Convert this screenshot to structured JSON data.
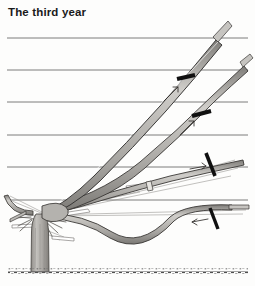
{
  "figure": {
    "title": "The third year",
    "background_color": "#fdfdfc"
  },
  "colors": {
    "ink": "#2b2b2b",
    "wire": "#6d6d6d",
    "branch_fill": "#b9b7b4",
    "branch_outline": "#3a3a3a",
    "trunk_fill": "#a9a7a3",
    "tie_black": "#111111",
    "ground": "#5a5a5a",
    "guide_line": "#9a9a9a"
  },
  "support_wires": {
    "label": "horizontal training wires",
    "count": 6,
    "x_start": 7,
    "x_end": 248,
    "y_positions": [
      38,
      70,
      102,
      135,
      167,
      200
    ]
  },
  "ground_line": {
    "label": "soil level",
    "y": 272,
    "x_start": 8,
    "x_end": 248
  },
  "trunk": {
    "label": "main trunk",
    "x": 37,
    "top_y": 215,
    "base_y": 272,
    "width": 13
  },
  "branches": [
    {
      "name": "upper-left-main-arm",
      "description": "steep left arm rising to top right",
      "tie_marker": true
    },
    {
      "name": "second-arm",
      "description": "second arm rising at shallower angle",
      "tie_marker": true
    },
    {
      "name": "third-arm",
      "description": "third arm nearly horizontal upper",
      "tie_marker": true
    },
    {
      "name": "lower-arm",
      "description": "lowest arm running along bottom wire",
      "tie_marker": true
    },
    {
      "name": "left-low-arm",
      "description": "short arm trained to the left",
      "tie_marker": false
    }
  ],
  "tie_markers": {
    "label": "pruning cut / tie marks",
    "count": 4,
    "items": [
      {
        "name": "tie-mark-1",
        "x": 186,
        "y": 78,
        "angle": -72
      },
      {
        "name": "tie-mark-2",
        "x": 201,
        "y": 114,
        "angle": -70
      },
      {
        "name": "tie-mark-3",
        "x": 211,
        "y": 164,
        "angle": -15
      },
      {
        "name": "tie-mark-4",
        "x": 214,
        "y": 218,
        "angle": -15
      }
    ]
  },
  "growth_arrows": {
    "label": "direction-of-growth arrows",
    "count": 4
  },
  "shoots": {
    "label": "thin pruned shoot outlines",
    "count": 10
  }
}
